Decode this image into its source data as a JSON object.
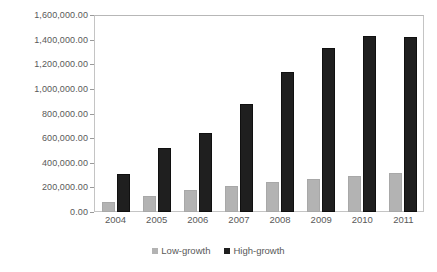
{
  "chart_data": {
    "type": "bar",
    "title": "",
    "subtitle": "",
    "xlabel": "",
    "ylabel": "",
    "categories": [
      "2004",
      "2005",
      "2006",
      "2007",
      "2008",
      "2009",
      "2010",
      "2011"
    ],
    "series": [
      {
        "name": "Low-growth",
        "color": "#b3b3b3",
        "values": [
          80000,
          130000,
          180000,
          212000,
          240000,
          270000,
          295000,
          320000
        ]
      },
      {
        "name": "High-growth",
        "color": "#1f1f1f",
        "values": [
          310000,
          520000,
          640000,
          880000,
          1140000,
          1330000,
          1430000,
          1420000
        ]
      }
    ],
    "ylim": [
      0,
      1600000
    ],
    "ytick_values": [
      0,
      200000,
      400000,
      600000,
      800000,
      1000000,
      1200000,
      1400000,
      1600000
    ],
    "ytick_labels": [
      "0.00",
      "200,000.00",
      "400,000.00",
      "600,000.00",
      "800,000.00",
      "1,000,000.00",
      "1,200,000.00",
      "1,400,000.00",
      "1,600,000.00"
    ],
    "grid": false,
    "legend_position": "bottom",
    "plot_border": true
  }
}
